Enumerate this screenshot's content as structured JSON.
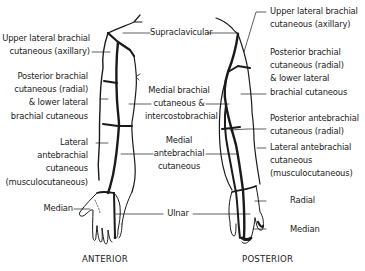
{
  "diagram": {
    "type": "anatomical-dermatome-map",
    "views": {
      "anterior": {
        "caption": "ANTERIOR",
        "labels_left": [
          {
            "id": "upper-lateral-brachial",
            "text": "Upper lateral brachial\ncutaneous (axillary)"
          },
          {
            "id": "posterior-brachial",
            "text": "Posterior brachial\ncutaneous (radial)\n& lower lateral\nbrachial cutaneous"
          },
          {
            "id": "lateral-antebrachial",
            "text": "Lateral\nantebrachial\ncutaneous\n(musculocutaneous)"
          },
          {
            "id": "median",
            "text": "Median"
          }
        ]
      },
      "center_labels": [
        {
          "id": "supraclavicular",
          "text": "Supraclavicular"
        },
        {
          "id": "medial-brachial",
          "text": "Medial brachial\ncutaneous &\nintercostobrachial"
        },
        {
          "id": "medial-antebrachial",
          "text": "Medial\nantebrachial\ncutaneous"
        },
        {
          "id": "ulnar",
          "text": "Ulnar"
        }
      ],
      "posterior": {
        "caption": "POSTERIOR",
        "labels_right": [
          {
            "id": "upper-lateral-brachial",
            "text": "Upper lateral brachial\ncutaneous (axillary)"
          },
          {
            "id": "posterior-brachial",
            "text": "Posterior brachial\ncutaneous (radial)\n& lower lateral\nbrachial cutaneous"
          },
          {
            "id": "posterior-antebrachial",
            "text": "Posterior antebrachial\ncutaneous (radial)"
          },
          {
            "id": "lateral-antebrachial",
            "text": "Lateral antebrachial\ncutaneous\n(musculocutaneous)"
          },
          {
            "id": "radial",
            "text": "Radial"
          },
          {
            "id": "median",
            "text": "Median"
          }
        ]
      }
    },
    "colors": {
      "line": "#1a1a1a",
      "background": "#ffffff"
    }
  }
}
